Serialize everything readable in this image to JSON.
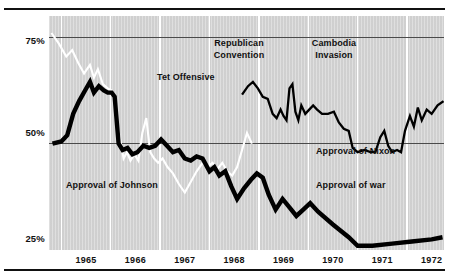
{
  "chart_data": {
    "type": "line",
    "title": "",
    "subtitle": "",
    "xlabel": "",
    "ylabel": "",
    "xlim": [
      1964.75,
      1972.75
    ],
    "ylim": [
      25,
      80
    ],
    "ytick_values": [
      75,
      50,
      25
    ],
    "ytick_labels": [
      "75%",
      "50%",
      "25%"
    ],
    "gridlines": {
      "horizontal_at": [
        75,
        50
      ],
      "vertical_at": [
        1965,
        1966,
        1967,
        1968,
        1969,
        1970,
        1971,
        1972
      ],
      "grid_on": true
    },
    "xtick_values": [
      1965,
      1966,
      1967,
      1968,
      1969,
      1970,
      1971,
      1972
    ],
    "xtick_labels": [
      "1965",
      "1966",
      "1967",
      "1968",
      "1969",
      "1970",
      "1971",
      "1972"
    ],
    "legend_position": "inline-annotations",
    "series": [
      {
        "name": "Approval of Johnson",
        "color": "#ffffff",
        "style": "thin-white",
        "points": [
          [
            1964.8,
            76.0
          ],
          [
            1964.95,
            73.5
          ],
          [
            1965.1,
            70.5
          ],
          [
            1965.22,
            72.0
          ],
          [
            1965.34,
            69.0
          ],
          [
            1965.46,
            66.5
          ],
          [
            1965.58,
            68.5
          ],
          [
            1965.66,
            65.5
          ],
          [
            1965.74,
            67.5
          ],
          [
            1965.84,
            64.0
          ],
          [
            1965.94,
            63.0
          ],
          [
            1966.02,
            62.5
          ],
          [
            1966.08,
            61.5
          ],
          [
            1966.14,
            54.0
          ],
          [
            1966.2,
            50.5
          ],
          [
            1966.26,
            46.5
          ],
          [
            1966.33,
            48.0
          ],
          [
            1966.4,
            46.0
          ],
          [
            1966.48,
            47.5
          ],
          [
            1966.56,
            46.0
          ],
          [
            1966.64,
            52.5
          ],
          [
            1966.72,
            56.0
          ],
          [
            1966.8,
            48.0
          ],
          [
            1966.88,
            46.5
          ],
          [
            1966.96,
            45.5
          ],
          [
            1967.05,
            46.5
          ],
          [
            1967.15,
            44.5
          ],
          [
            1967.26,
            43.0
          ],
          [
            1967.38,
            40.5
          ],
          [
            1967.5,
            38.5
          ],
          [
            1967.62,
            41.0
          ],
          [
            1967.74,
            43.5
          ],
          [
            1967.86,
            45.5
          ],
          [
            1967.96,
            44.5
          ],
          [
            1968.06,
            45.5
          ],
          [
            1968.16,
            44.0
          ],
          [
            1968.26,
            45.5
          ],
          [
            1968.36,
            43.5
          ],
          [
            1968.46,
            42.5
          ],
          [
            1968.56,
            44.5
          ],
          [
            1968.66,
            48.5
          ],
          [
            1968.76,
            52.5
          ],
          [
            1968.86,
            50.0
          ]
        ]
      },
      {
        "name": "Approval of war",
        "color": "#000000",
        "style": "thick-black",
        "points": [
          [
            1964.82,
            50.0
          ],
          [
            1965.0,
            50.5
          ],
          [
            1965.12,
            52.0
          ],
          [
            1965.24,
            57.0
          ],
          [
            1965.36,
            60.0
          ],
          [
            1965.48,
            62.5
          ],
          [
            1965.58,
            64.5
          ],
          [
            1965.66,
            62.0
          ],
          [
            1965.76,
            63.5
          ],
          [
            1965.86,
            62.5
          ],
          [
            1965.94,
            62.0
          ],
          [
            1966.02,
            62.0
          ],
          [
            1966.08,
            61.0
          ],
          [
            1966.16,
            50.0
          ],
          [
            1966.24,
            48.5
          ],
          [
            1966.34,
            49.0
          ],
          [
            1966.44,
            47.5
          ],
          [
            1966.54,
            48.0
          ],
          [
            1966.66,
            49.5
          ],
          [
            1966.78,
            49.0
          ],
          [
            1966.9,
            49.5
          ],
          [
            1967.02,
            51.0
          ],
          [
            1967.14,
            49.5
          ],
          [
            1967.26,
            48.0
          ],
          [
            1967.38,
            48.5
          ],
          [
            1967.5,
            46.5
          ],
          [
            1967.62,
            46.0
          ],
          [
            1967.74,
            47.0
          ],
          [
            1967.86,
            46.5
          ],
          [
            1968.0,
            43.5
          ],
          [
            1968.1,
            44.5
          ],
          [
            1968.2,
            42.5
          ],
          [
            1968.32,
            43.5
          ],
          [
            1968.44,
            40.0
          ],
          [
            1968.56,
            37.0
          ],
          [
            1968.7,
            39.5
          ],
          [
            1968.84,
            41.5
          ],
          [
            1968.96,
            43.0
          ],
          [
            1969.08,
            42.0
          ],
          [
            1969.2,
            38.0
          ],
          [
            1969.34,
            34.5
          ],
          [
            1969.48,
            37.0
          ],
          [
            1969.62,
            35.0
          ],
          [
            1969.76,
            33.0
          ],
          [
            1969.9,
            34.5
          ],
          [
            1970.04,
            36.0
          ],
          [
            1970.2,
            34.0
          ],
          [
            1970.5,
            31.0
          ],
          [
            1970.82,
            28.0
          ],
          [
            1971.0,
            26.0
          ],
          [
            1971.3,
            26.0
          ],
          [
            1971.7,
            26.5
          ],
          [
            1972.1,
            27.0
          ],
          [
            1972.5,
            27.5
          ],
          [
            1972.72,
            28.0
          ]
        ]
      },
      {
        "name": "Approval of Nixon",
        "color": "#000000",
        "style": "medium-black",
        "points": [
          [
            1968.66,
            61.5
          ],
          [
            1968.78,
            63.5
          ],
          [
            1968.88,
            64.5
          ],
          [
            1968.98,
            63.0
          ],
          [
            1969.08,
            61.0
          ],
          [
            1969.18,
            60.5
          ],
          [
            1969.28,
            57.0
          ],
          [
            1969.36,
            56.0
          ],
          [
            1969.44,
            58.0
          ],
          [
            1969.5,
            56.5
          ],
          [
            1969.56,
            55.5
          ],
          [
            1969.62,
            63.0
          ],
          [
            1969.68,
            64.0
          ],
          [
            1969.74,
            57.5
          ],
          [
            1969.8,
            55.5
          ],
          [
            1969.86,
            59.0
          ],
          [
            1969.94,
            57.0
          ],
          [
            1970.02,
            58.0
          ],
          [
            1970.1,
            59.0
          ],
          [
            1970.18,
            58.0
          ],
          [
            1970.28,
            57.0
          ],
          [
            1970.4,
            57.0
          ],
          [
            1970.52,
            57.5
          ],
          [
            1970.62,
            55.0
          ],
          [
            1970.72,
            53.5
          ],
          [
            1970.82,
            53.0
          ],
          [
            1970.9,
            49.0
          ],
          [
            1971.0,
            48.0
          ],
          [
            1971.14,
            48.5
          ],
          [
            1971.26,
            48.0
          ],
          [
            1971.36,
            48.0
          ],
          [
            1971.46,
            51.5
          ],
          [
            1971.54,
            53.0
          ],
          [
            1971.62,
            49.5
          ],
          [
            1971.7,
            48.0
          ],
          [
            1971.8,
            48.5
          ],
          [
            1971.88,
            48.0
          ],
          [
            1971.96,
            53.0
          ],
          [
            1972.06,
            56.5
          ],
          [
            1972.14,
            54.0
          ],
          [
            1972.22,
            58.5
          ],
          [
            1972.3,
            55.5
          ],
          [
            1972.4,
            58.0
          ],
          [
            1972.5,
            57.0
          ],
          [
            1972.62,
            59.0
          ],
          [
            1972.74,
            60.0
          ]
        ]
      }
    ],
    "annotations": [
      {
        "id": "republican-convention",
        "text_line1": "Republican",
        "text_line2": "Convention"
      },
      {
        "id": "cambodia-invasion",
        "text_line1": "Cambodia",
        "text_line2": "Invasion"
      },
      {
        "id": "tet-offensive",
        "text_line1": "Tet Offensive",
        "text_line2": ""
      },
      {
        "id": "approval-of-nixon",
        "text_line1": "Approval of Nixon",
        "text_line2": ""
      },
      {
        "id": "approval-of-war",
        "text_line1": "Approval of war",
        "text_line2": ""
      },
      {
        "id": "approval-of-johnson",
        "text_line1": "Approval of Johnson",
        "text_line2": ""
      }
    ],
    "colors": {
      "plot_background": "#d7d7d7",
      "page_background": "#ffffff",
      "axis_rule": "#111111",
      "gridline_horizontal": "#4a4a4a",
      "gridline_vertical": "#ffffff",
      "series_johnson": "#ffffff",
      "series_war": "#000000",
      "series_nixon": "#000000"
    }
  }
}
